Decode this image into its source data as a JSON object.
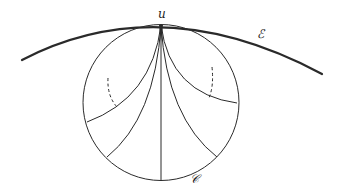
{
  "diagram": {
    "labels": {
      "point_u": "u",
      "curve_E": "ℰ",
      "circle_C": "𝒞"
    },
    "colors": {
      "stroke": "#2a2a2a",
      "background": "#ffffff"
    },
    "elements": {
      "outer_arc": "thick arc through point u (curve ℰ)",
      "circle": "circle 𝒞 tangent to ℰ at u",
      "geodesics_from_u": 5,
      "dashed_arcs": 2
    }
  }
}
